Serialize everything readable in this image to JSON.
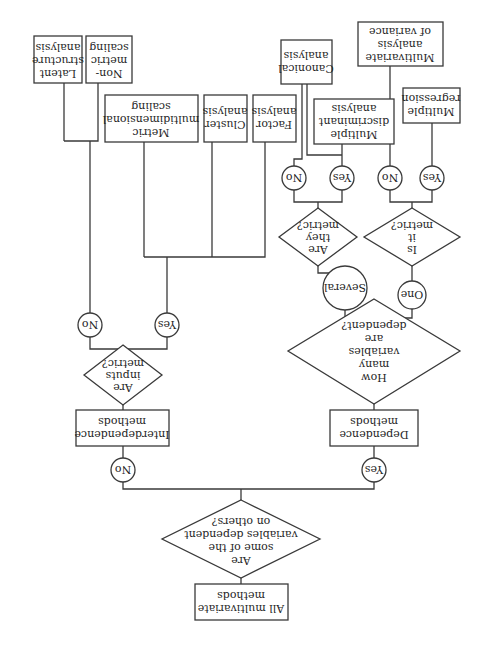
{
  "diagram": {
    "orientation": "rotated-180",
    "root": {
      "label": [
        "All multivariate",
        "methods"
      ]
    },
    "q1": {
      "label": [
        "Are",
        "some of the",
        "variables dependent",
        "on others?"
      ]
    },
    "branch_yes": "Yes",
    "branch_no": "No",
    "dependence": {
      "label": [
        "Dependence",
        "methods"
      ]
    },
    "interdependence": {
      "label": [
        "Interdependence",
        "methods"
      ]
    },
    "q_how_many": {
      "label": [
        "How",
        "many",
        "variables",
        "are",
        "dependent?"
      ]
    },
    "one": "One",
    "several": "Several",
    "q_is_it_metric": {
      "label": [
        "Is",
        "it",
        "metric?"
      ]
    },
    "q_are_they_metric": {
      "label": [
        "Are",
        "they",
        "metric?"
      ]
    },
    "q_are_inputs_metric": {
      "label": [
        "Are",
        "inputs",
        "metric?"
      ]
    },
    "yes": "Yes",
    "no": "No",
    "leaves": {
      "multiple_regression": [
        "Multiple",
        "regression"
      ],
      "manova": [
        "Multivariate",
        "analysis",
        "of variance"
      ],
      "mda": [
        "Multiple",
        "discriminant",
        "analysis"
      ],
      "canonical": [
        "Canonical",
        "analysis"
      ],
      "factor": [
        "Factor",
        "analysis"
      ],
      "cluster": [
        "Cluster",
        "analysis"
      ],
      "metric_mds": [
        "Metric",
        "multidimensional",
        "scaling"
      ],
      "nonmetric_scaling": [
        "Non-",
        "metric",
        "scaling"
      ],
      "latent_structure": [
        "Latent",
        "structure",
        "analysis"
      ]
    }
  }
}
